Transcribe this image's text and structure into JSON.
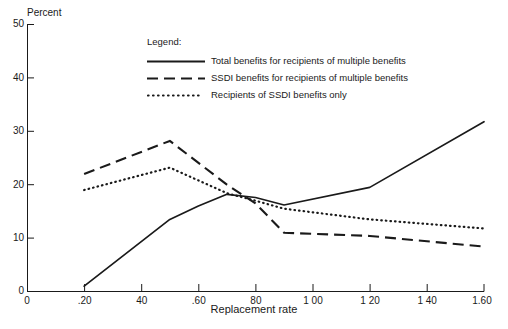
{
  "chart_data": {
    "type": "line",
    "title": "",
    "xlabel": "Replacement rate",
    "ylabel": "Percent",
    "xlim": [
      0,
      1.6
    ],
    "ylim": [
      0,
      50
    ],
    "grid": false,
    "legend_position": "upper-center",
    "legend_title": "Legend:",
    "xticks": [
      0,
      0.2,
      0.4,
      0.6,
      0.8,
      1.0,
      1.2,
      1.4,
      1.6
    ],
    "xtick_labels": [
      "0",
      ".20",
      "40",
      ".60",
      "80",
      "1 00",
      "1 20",
      "1 40",
      "1.60"
    ],
    "yticks": [
      0,
      10,
      20,
      30,
      40,
      50
    ],
    "ytick_labels": [
      "0",
      "10",
      "20",
      "30",
      "40",
      "50"
    ],
    "series": [
      {
        "name": "Total benefits for recipients of multiple benefits",
        "style": "solid",
        "x": [
          0.2,
          0.5,
          0.6,
          0.7,
          0.8,
          0.9,
          1.2,
          1.6
        ],
        "values": [
          1.0,
          13.5,
          16.0,
          18.2,
          17.6,
          16.2,
          19.5,
          31.8
        ]
      },
      {
        "name": "SSDI benefits for recipients of multiple benefits",
        "style": "dashed",
        "x": [
          0.2,
          0.5,
          0.7,
          0.8,
          0.9,
          1.2,
          1.6
        ],
        "values": [
          22.0,
          28.2,
          20.0,
          16.5,
          11.0,
          10.4,
          8.4
        ]
      },
      {
        "name": "Recipients of SSDI benefits only",
        "style": "dotted",
        "x": [
          0.2,
          0.5,
          0.7,
          0.8,
          0.9,
          1.2,
          1.6
        ],
        "values": [
          19.0,
          23.2,
          18.4,
          17.0,
          15.5,
          13.5,
          11.8
        ]
      }
    ]
  },
  "axes": {
    "ylabel": "Percent",
    "xlabel": "Replacement rate",
    "ytick_0": "0",
    "ytick_10": "10",
    "ytick_20": "20",
    "ytick_30": "30",
    "ytick_40": "40",
    "ytick_50": "50",
    "origin_label": "0",
    "xtick_0": "0",
    "xtick_20": ".20",
    "xtick_40": "40",
    "xtick_60": ".60",
    "xtick_80": "80",
    "xtick_100": "1 00",
    "xtick_120": "1 20",
    "xtick_140": "1 40",
    "xtick_160": "1.60"
  },
  "legend": {
    "title": "Legend:",
    "items": [
      {
        "label": "Total benefits for recipients of multiple benefits",
        "style": "solid"
      },
      {
        "label": "SSDI benefits for recipients of multiple benefits",
        "style": "dashed"
      },
      {
        "label": "Recipients of SSDI benefits only",
        "style": "dotted"
      }
    ]
  },
  "colors": {
    "ink": "#1a1a1a",
    "background": "#ffffff"
  }
}
